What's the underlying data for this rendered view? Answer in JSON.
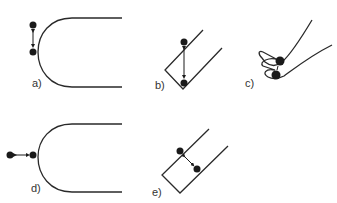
{
  "figure": {
    "panels": [
      {
        "id": "a",
        "label": "a)",
        "shape": "U-shaped curved surface (opening right)",
        "particles": 2,
        "motion": "vertical oscillation along tangent"
      },
      {
        "id": "b",
        "label": "b)",
        "shape": "V-shaped groove / inclined channel",
        "particles": 2,
        "motion": "vertical between wall and corner"
      },
      {
        "id": "c",
        "label": "c)",
        "shape": "folded / wavy surface with slit",
        "particles": 2,
        "motion": "between folds"
      },
      {
        "id": "d",
        "label": "d)",
        "shape": "U-shaped curved surface (opening right)",
        "particles": 2,
        "motion": "horizontal, perpendicular to surface"
      },
      {
        "id": "e",
        "label": "e)",
        "shape": "inclined rectangular channel",
        "particles": 2,
        "motion": "diagonal across channel"
      }
    ],
    "colors": {
      "line": "#2a2a2a",
      "particle": "#1a1a1a",
      "label": "#333333",
      "background": "#ffffff"
    }
  }
}
